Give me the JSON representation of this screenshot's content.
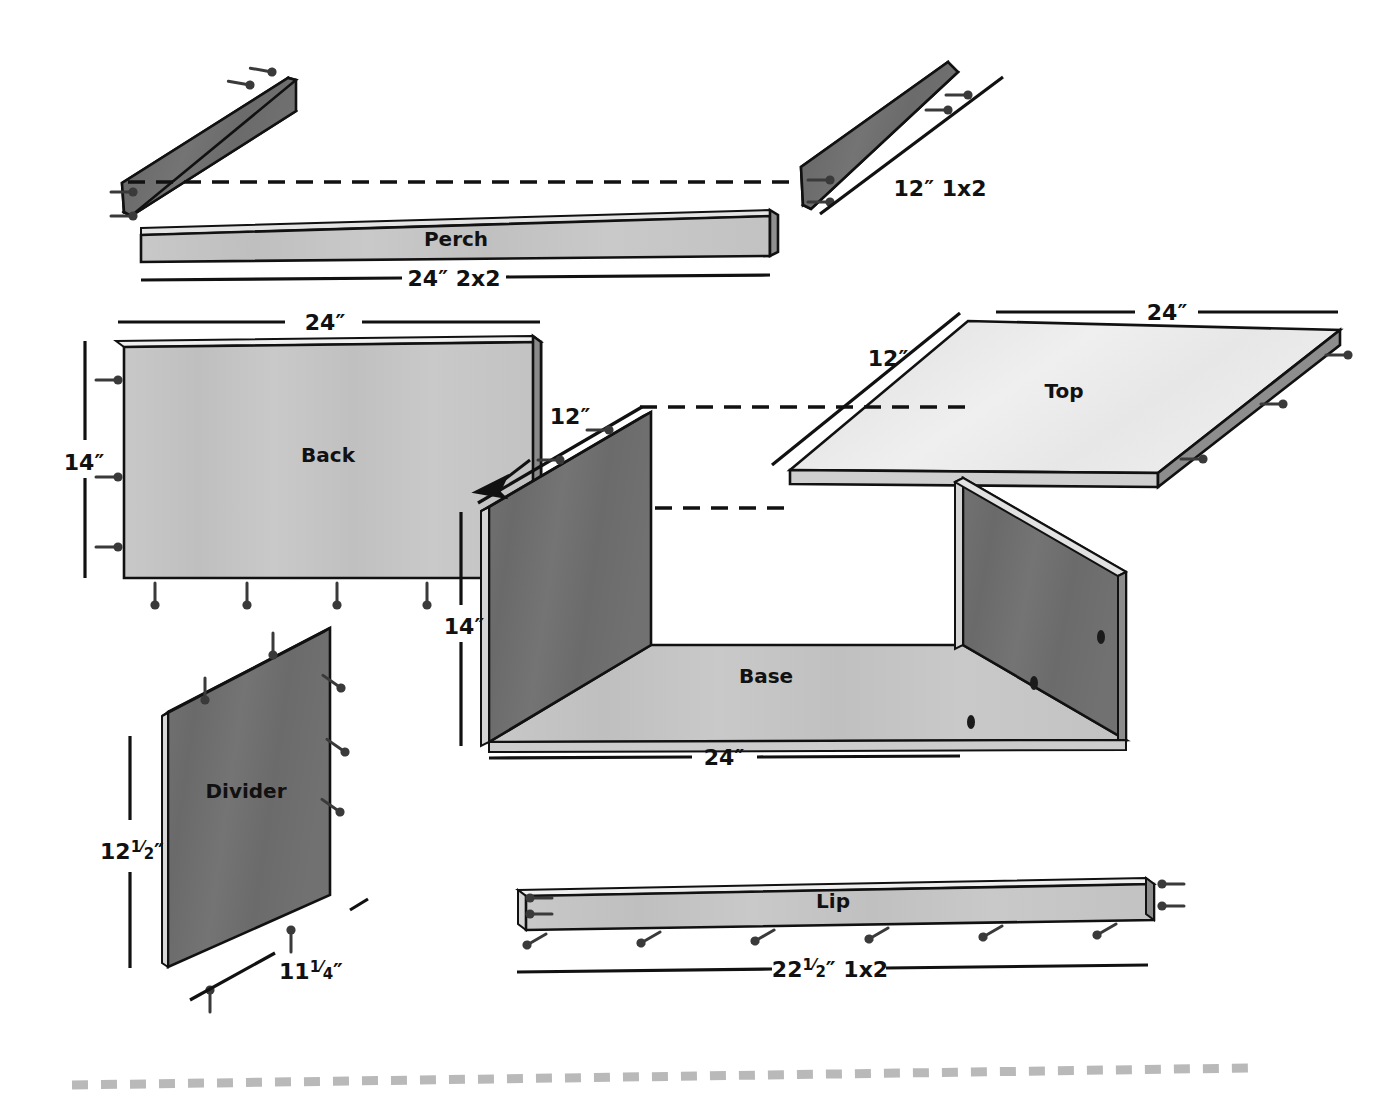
{
  "diagram": {
    "type": "exploded-view-woodworking-plan",
    "colors": {
      "face_light": "#eaeaea",
      "face_mid": "#c4c4c4",
      "face_dark": "#6e6e6e",
      "edge_highlight": "#d9d9d9",
      "outline": "#111111",
      "border_dash": "#b9b9b9"
    },
    "parts": [
      {
        "id": "perch-back-rail",
        "label": "",
        "dimension": "",
        "shade": "dark",
        "note": "angled rail above perch"
      },
      {
        "id": "perch",
        "label": "Perch",
        "dimension": "24″ 2x2",
        "shade": "mid"
      },
      {
        "id": "side-rail-12",
        "label": "",
        "dimension": "12″ 1x2",
        "shade": "dark"
      },
      {
        "id": "back",
        "label": "Back",
        "dimension_width": "24″",
        "dimension_height": "14″",
        "shade": "mid"
      },
      {
        "id": "top",
        "label": "Top",
        "dimension_width": "24″",
        "dimension_depth": "12″",
        "shade": "light"
      },
      {
        "id": "base",
        "label": "Base",
        "dimension_width": "24″",
        "dimension_height": "14″",
        "dimension_depth": "12″",
        "shade": "mid-with-dark-sides"
      },
      {
        "id": "divider",
        "label": "Divider",
        "dimension_height": "12¹⁄₂″",
        "dimension_width": "11¹⁄₄″",
        "shade": "dark"
      },
      {
        "id": "lip",
        "label": "Lip",
        "dimension": "22¹⁄₂″ 1x2",
        "shade": "mid"
      }
    ],
    "labels": {
      "perch": "Perch",
      "back": "Back",
      "top": "Top",
      "base": "Base",
      "divider": "Divider",
      "lip": "Lip"
    },
    "dimensions": {
      "perch_len": "24″ 2x2",
      "side_rail": "12″ 1x2",
      "back_width": "24″",
      "back_height": "14″",
      "base_depth_12": "12″",
      "base_height_14": "14″",
      "base_width_24": "24″",
      "top_width": "24″",
      "top_depth": "12″",
      "divider_height_whole": "12",
      "divider_height_num": "1",
      "divider_height_den": "2",
      "divider_height_unit": "″",
      "divider_width_whole": "11",
      "divider_width_num": "1",
      "divider_width_den": "4",
      "divider_width_unit": "″",
      "lip_whole": "22",
      "lip_num": "1",
      "lip_den": "2",
      "lip_rest": "″ 1x2"
    }
  }
}
